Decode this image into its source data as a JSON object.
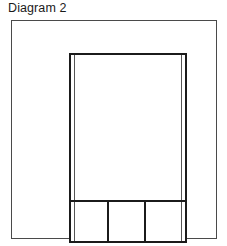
{
  "page": {
    "background_color": "#ffffff",
    "width": 227,
    "height": 246
  },
  "title": {
    "text": "Diagram 2",
    "color": "#1a1a1a"
  },
  "drawing": {
    "outer_frame": {
      "label": "",
      "stroke_color": "#4a4a4a",
      "fill_color": "#ffffff"
    },
    "inner_rectangle": {
      "label": "",
      "stroke_color": "#1b1b1b",
      "fill_color": "#ffffff"
    },
    "upper_area": {
      "label": ""
    },
    "bottom_cells": [
      {
        "label": ""
      },
      {
        "label": ""
      },
      {
        "label": ""
      }
    ]
  }
}
